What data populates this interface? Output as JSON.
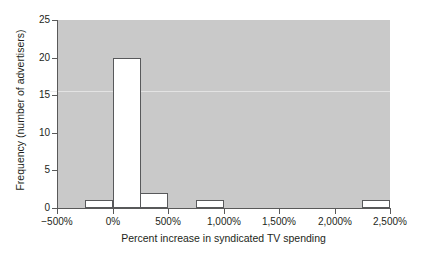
{
  "chart_data": {
    "type": "bar",
    "title": "",
    "subtitle": "",
    "xlabel": "Percent increase in syndicated TV spending",
    "ylabel": "Frequency (number of advertisers)",
    "xlim": [
      -500,
      2500
    ],
    "ylim": [
      0,
      25
    ],
    "grid": false,
    "legend": null,
    "bin_width": 250,
    "x_ticks": [
      -500,
      0,
      500,
      1000,
      1500,
      2000,
      2500
    ],
    "x_tick_labels": [
      "−500%",
      "0%",
      "500%",
      "1,000%",
      "1,500%",
      "2,000%",
      "2,500%"
    ],
    "y_ticks": [
      0,
      5,
      10,
      15,
      20,
      25
    ],
    "y_tick_labels": [
      "0",
      "5",
      "10",
      "15",
      "20",
      "25"
    ],
    "categories": [
      "-250% to 0%",
      "0% to 250%",
      "250% to 500%",
      "750% to 1,000%",
      "2,250% to 2,500%"
    ],
    "values": [
      1,
      20,
      2,
      1,
      1
    ],
    "bars": [
      {
        "bin_start": -250,
        "bin_end": 0,
        "value": 1
      },
      {
        "bin_start": 0,
        "bin_end": 250,
        "value": 20
      },
      {
        "bin_start": 250,
        "bin_end": 500,
        "value": 2
      },
      {
        "bin_start": 750,
        "bin_end": 1000,
        "value": 1
      },
      {
        "bin_start": 2250,
        "bin_end": 2500,
        "value": 1
      }
    ],
    "colors": {
      "plot_background": "#c9c9c9",
      "bar_fill": "#ffffff",
      "bar_edge": "#58595b",
      "axis": "#595959",
      "text": "#231f20",
      "page_background": "#ffffff"
    }
  }
}
